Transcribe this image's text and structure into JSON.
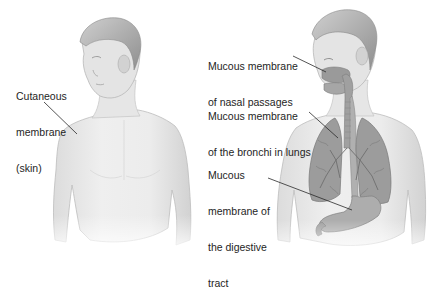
{
  "diagram": {
    "title": "",
    "colors": {
      "background": "#ffffff",
      "skin": "#e9e9e9",
      "skin_shadow": "#cfcfcf",
      "hair": "#b5b5b5",
      "organ": "#9a9a9a",
      "organ_dark": "#7c7c7c",
      "leader_line": "#2a2a2a",
      "text": "#1e1e1e"
    },
    "figures": [
      {
        "id": "left-figure",
        "description": "Torso and head of a man turned to the side, showing the skin",
        "labels": [
          {
            "id": "cutaneous-membrane",
            "lines": [
              "Cutaneous",
              "membrane",
              "(skin)"
            ]
          }
        ]
      },
      {
        "id": "right-figure",
        "description": "Torso and head of a man showing internal respiratory and digestive structures",
        "labels": [
          {
            "id": "mucous-nasal",
            "lines": [
              "Mucous membrane",
              "of nasal passages"
            ]
          },
          {
            "id": "mucous-bronchi",
            "lines": [
              "Mucous membrane",
              "of the bronchi in lungs"
            ]
          },
          {
            "id": "mucous-digestive",
            "lines": [
              "Mucous",
              "membrane of",
              "the digestive",
              "tract"
            ]
          }
        ]
      }
    ]
  }
}
